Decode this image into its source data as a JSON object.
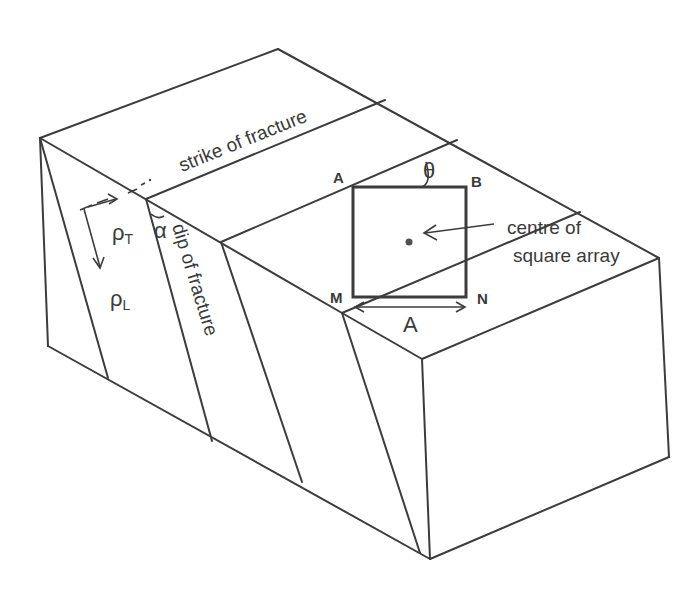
{
  "diagram": {
    "labels": {
      "strike": "strike of fracture",
      "dip": "dip of fracture",
      "rho_t": "ρ",
      "rho_t_sub": "T",
      "rho_l": "ρ",
      "rho_l_sub": "L",
      "alpha": "α",
      "theta": "θ",
      "corner_a": "A",
      "corner_b": "B",
      "corner_m": "M",
      "corner_n": "N",
      "spacing": "A",
      "centre_line1": "centre of",
      "centre_line2": "square array"
    },
    "colors": {
      "line": "#3c3c3c",
      "text": "#3a3a3a",
      "background": "#ffffff"
    }
  }
}
